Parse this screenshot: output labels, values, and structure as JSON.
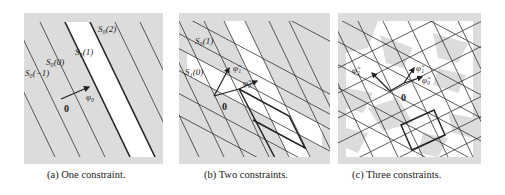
{
  "figure": {
    "colors": {
      "shaded": "#dcdcdc",
      "unshaded": "#ffffff",
      "line": "#333333"
    },
    "panels": [
      {
        "id": "a",
        "caption": "(a) One constraint.",
        "labels": {
          "s0_m1": "S₀(−1)",
          "s0_0": "S₀(0)",
          "s0_1": "S₀(1)",
          "s0_2": "S₀(2)",
          "origin": "0",
          "phi0": "φ₀"
        }
      },
      {
        "id": "b",
        "caption": "(b) Two constraints.",
        "labels": {
          "s0_1": "S₀(1)",
          "s1_0": "S₁(0)",
          "origin": "0",
          "phi0": "φ̃₀",
          "phi1": "φ̃₁"
        }
      },
      {
        "id": "c",
        "caption": "(c) Three constraints.",
        "labels": {
          "origin": "0",
          "phi0": "φ̃₀",
          "phi1": "φ̃₁",
          "phi2": "φ̃₂"
        }
      }
    ]
  }
}
